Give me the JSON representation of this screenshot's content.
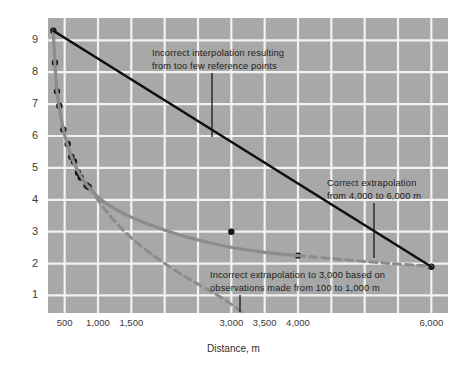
{
  "chart_data": {
    "type": "line",
    "title": "",
    "subtitle": "",
    "xlabel": "Distance, m",
    "ylabel": "",
    "xlim": [
      250,
      6250
    ],
    "ylim": [
      0.45,
      9.7
    ],
    "grid": true,
    "legend_position": "none",
    "plot_background": "#a8a8a8",
    "gridline_color": "#f2f2f2",
    "x_ticks": [
      500,
      1000,
      1500,
      3000,
      3500,
      4000,
      6000
    ],
    "x_tick_labels": [
      "500",
      "1,000",
      "1,500",
      "3,000",
      "3,500",
      "4,000",
      "6,000"
    ],
    "y_ticks": [
      1,
      2,
      3,
      4,
      5,
      6,
      7,
      8,
      9
    ],
    "y_tick_labels": [
      "1",
      "2",
      "3",
      "4",
      "5",
      "6",
      "7",
      "8",
      "9"
    ],
    "series": [
      {
        "name": "observed-reference-points",
        "type": "scatter",
        "color": "#151515",
        "points": [
          [
            330,
            9.3
          ],
          [
            355,
            8.3
          ],
          [
            385,
            7.4
          ],
          [
            420,
            6.95
          ],
          [
            480,
            6.2
          ],
          [
            545,
            5.75
          ],
          [
            600,
            5.35
          ],
          [
            640,
            5.2
          ],
          [
            700,
            4.85
          ],
          [
            740,
            4.7
          ],
          [
            830,
            4.45
          ],
          [
            860,
            4.4
          ],
          [
            3000,
            3.0
          ],
          [
            4000,
            2.25
          ],
          [
            6000,
            1.9
          ]
        ]
      },
      {
        "name": "correct-curve-fit",
        "type": "line",
        "style": "solid",
        "color": "#8c8c8c",
        "points": [
          [
            330,
            9.3
          ],
          [
            350,
            8.4
          ],
          [
            380,
            7.5
          ],
          [
            420,
            6.9
          ],
          [
            480,
            6.2
          ],
          [
            545,
            5.7
          ],
          [
            620,
            5.25
          ],
          [
            700,
            4.9
          ],
          [
            800,
            4.55
          ],
          [
            900,
            4.3
          ],
          [
            1100,
            3.92
          ],
          [
            1400,
            3.55
          ],
          [
            1800,
            3.2
          ],
          [
            2300,
            2.85
          ],
          [
            2900,
            2.55
          ],
          [
            3500,
            2.35
          ],
          [
            4000,
            2.25
          ]
        ]
      },
      {
        "name": "correct-extrapolation-dashed",
        "type": "line",
        "style": "dashed",
        "color": "#8c8c8c",
        "points": [
          [
            4000,
            2.25
          ],
          [
            4700,
            2.12
          ],
          [
            5400,
            2.0
          ],
          [
            6000,
            1.92
          ]
        ]
      },
      {
        "name": "incorrect-interpolation-straight",
        "type": "line",
        "style": "solid",
        "color": "#0f0f0f",
        "points": [
          [
            330,
            9.3
          ],
          [
            6000,
            1.9
          ]
        ]
      },
      {
        "name": "incorrect-extrapolation-dashed",
        "type": "line",
        "style": "dashed",
        "color": "#8c8c8c",
        "points": [
          [
            870,
            4.4
          ],
          [
            1100,
            3.7
          ],
          [
            1400,
            3.0
          ],
          [
            1800,
            2.3
          ],
          [
            2300,
            1.6
          ],
          [
            2800,
            1.0
          ],
          [
            3150,
            0.5
          ]
        ]
      }
    ],
    "annotations": [
      {
        "name": "incorrect-interpolation-note",
        "line1": "Incorrect interpolation resulting",
        "line2": "from too few reference points",
        "text_x": 152,
        "text_y": 47,
        "leader_x": 212,
        "leader_y1": 73,
        "leader_y2": 137
      },
      {
        "name": "correct-extrapolation-note",
        "line1": "Correct extrapolation",
        "line2": "from 4,000 to 6,000 m",
        "text_x": 327,
        "text_y": 177,
        "leader_x": 374,
        "leader_y1": 203,
        "leader_y2": 258
      },
      {
        "name": "incorrect-extrapolation-note",
        "line1": "Incorrect extrapolation to 3,000 based on",
        "line2": "observations made from 100 to 1,000 m",
        "text_x": 210,
        "text_y": 269,
        "leader_x": 240,
        "leader_y1": 295,
        "leader_y2": 312
      }
    ]
  }
}
